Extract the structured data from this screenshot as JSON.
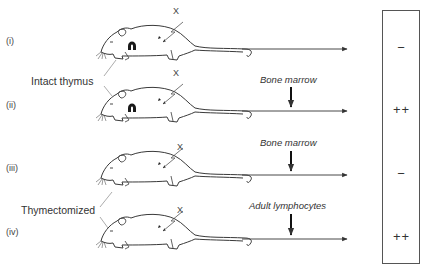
{
  "diagram": {
    "rows": [
      {
        "id": "i",
        "label": "(i)",
        "thymus": "intact",
        "treatment": "",
        "result": "−"
      },
      {
        "id": "ii",
        "label": "(ii)",
        "thymus": "intact",
        "treatment": "Bone marrow",
        "result": "++"
      },
      {
        "id": "iii",
        "label": "(iii)",
        "thymus": "thymectomized",
        "treatment": "Bone marrow",
        "result": "−"
      },
      {
        "id": "iv",
        "label": "(iv)",
        "thymus": "thymectomized",
        "treatment": "Adult lymphocytes",
        "result": "++"
      }
    ],
    "group_labels": {
      "intact": "Intact thymus",
      "thymectomized": "Thymectomized"
    },
    "irradiation_mark": "X",
    "colors": {
      "line": "#3a3a3a",
      "box": "#555555",
      "thymus": "#1a1a1a"
    }
  }
}
